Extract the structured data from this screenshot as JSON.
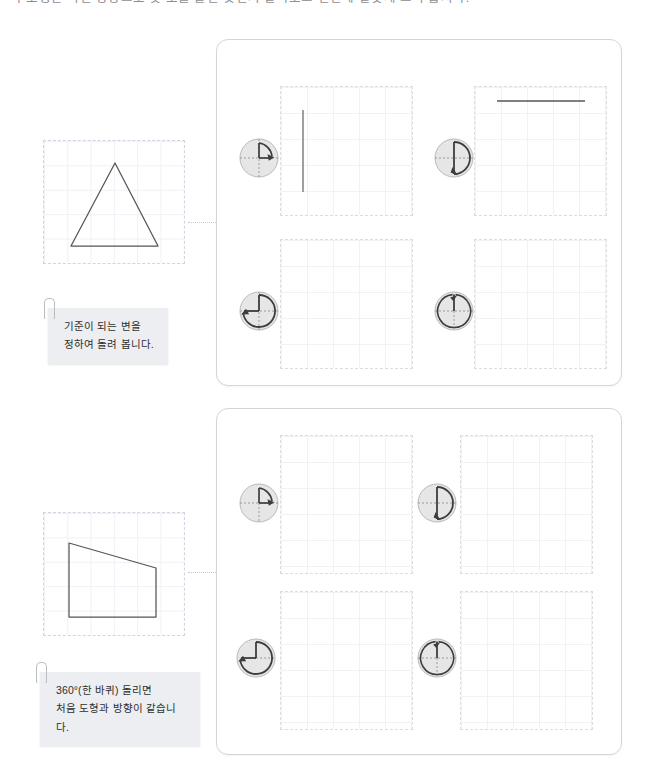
{
  "page": {
    "heading_clipped": "각 도형은 어떤 방향으로 몇 도를 돌린 것인지 알아보고 빈칸에 알맞게 그려 봅시다."
  },
  "colors": {
    "panel_border": "#d3d5d8",
    "cell_border": "#d9dde4",
    "grid_line": "#f0f2f6",
    "shape_stroke": "#555555",
    "dial_fill": "#e4e4e4",
    "dial_stroke": "#4a4a4a",
    "note_bg": "#eceef1",
    "connector": "#c8c8c8"
  },
  "exercises": [
    {
      "id": "exercise-1",
      "source_shape": {
        "name": "triangle",
        "label": "삼각형"
      },
      "note": {
        "line1": "기준이 되는 변을",
        "line2": "정하여 돌려 봅니다.",
        "text": "기준이 되는 변을\n정하여 돌려 봅니다."
      },
      "cells": [
        {
          "id": "cell-1-1",
          "dial": {
            "angle": 90,
            "angle_label": "90°",
            "direction": "clockwise"
          },
          "drawing": "vertical-line"
        },
        {
          "id": "cell-1-2",
          "dial": {
            "angle": 180,
            "angle_label": "180°",
            "direction": "clockwise"
          },
          "drawing": "horizontal-line"
        },
        {
          "id": "cell-1-3",
          "dial": {
            "angle": 270,
            "angle_label": "270°",
            "direction": "clockwise"
          },
          "drawing": "empty"
        },
        {
          "id": "cell-1-4",
          "dial": {
            "angle": 360,
            "angle_label": "360°",
            "direction": "clockwise"
          },
          "drawing": "empty"
        }
      ]
    },
    {
      "id": "exercise-2",
      "source_shape": {
        "name": "right-trapezoid",
        "label": "사다리꼴"
      },
      "note": {
        "line1": "360°(한 바퀴) 돌리면",
        "line2": "처음 도형과 방향이 같습니다.",
        "text": "360°(한 바퀴) 돌리면\n처음 도형과 방향이 같습니다."
      },
      "cells": [
        {
          "id": "cell-2-1",
          "dial": {
            "angle": 90,
            "angle_label": "90°",
            "direction": "clockwise"
          },
          "drawing": "empty"
        },
        {
          "id": "cell-2-2",
          "dial": {
            "angle": 180,
            "angle_label": "180°",
            "direction": "clockwise"
          },
          "drawing": "empty"
        },
        {
          "id": "cell-2-3",
          "dial": {
            "angle": 270,
            "angle_label": "270°",
            "direction": "clockwise"
          },
          "drawing": "empty"
        },
        {
          "id": "cell-2-4",
          "dial": {
            "angle": 360,
            "angle_label": "360°",
            "direction": "clockwise"
          },
          "drawing": "empty"
        }
      ]
    }
  ]
}
